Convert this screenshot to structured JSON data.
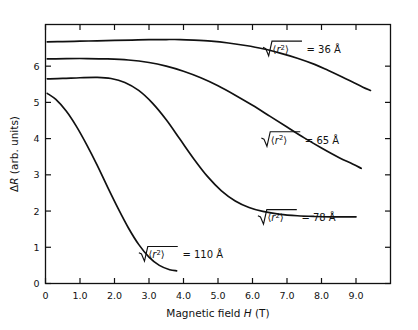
{
  "chart_data": {
    "type": "line",
    "title": "",
    "xlabel": "Magnetic field H (T)",
    "ylabel": "ΔR (arb. units)",
    "xlabel_parts": {
      "pre": "Magnetic  field  ",
      "italic": "H",
      "post": " (T)"
    },
    "ylabel_parts": {
      "delta": "Δ",
      "italic": "R",
      "post": " (arb. units)"
    },
    "xlim": [
      0,
      10.0
    ],
    "ylim": [
      0,
      7.15
    ],
    "xticks": [
      0,
      1.0,
      2.0,
      3.0,
      4.0,
      5.0,
      6.0,
      7.0,
      8.0,
      9.0
    ],
    "xticklabels": [
      "0",
      "1.0",
      "2.0",
      "3.0",
      "4.0",
      "5.0",
      "6.0",
      "7.0",
      "8.0",
      "9.0"
    ],
    "yticks": [
      0,
      1,
      2,
      3,
      4,
      5,
      6
    ],
    "yticklabels": [
      "0",
      "1",
      "2",
      "3",
      "4",
      "5",
      "6"
    ],
    "grid": false,
    "legend": "inline-annotations",
    "series": [
      {
        "name": "36 A",
        "label_prefix": "√",
        "label_radicand": "⟨r²⟩",
        "label_value": "= 36 Å",
        "label_x": 6.35,
        "label_y": 6.45,
        "x": [
          0.05,
          0.5,
          1.0,
          1.5,
          2.0,
          2.5,
          3.0,
          3.5,
          3.9,
          4.3,
          4.8,
          5.3,
          5.8,
          6.3,
          6.8,
          7.3,
          7.8,
          8.2,
          8.6,
          8.9,
          9.2,
          9.42
        ],
        "y": [
          6.67,
          6.68,
          6.69,
          6.7,
          6.71,
          6.72,
          6.73,
          6.735,
          6.735,
          6.72,
          6.69,
          6.64,
          6.57,
          6.48,
          6.36,
          6.22,
          6.05,
          5.88,
          5.7,
          5.56,
          5.42,
          5.33
        ]
      },
      {
        "name": "65 A",
        "label_prefix": "√",
        "label_radicand": "⟨r²⟩",
        "label_value": "= 65 Å",
        "label_x": 6.3,
        "label_y": 3.95,
        "x": [
          0.05,
          0.6,
          1.2,
          1.8,
          2.4,
          3.0,
          3.5,
          4.0,
          4.5,
          5.0,
          5.5,
          6.0,
          6.5,
          7.0,
          7.5,
          8.0,
          8.5,
          8.9,
          9.15
        ],
        "y": [
          6.2,
          6.21,
          6.21,
          6.2,
          6.17,
          6.1,
          6.0,
          5.86,
          5.68,
          5.46,
          5.2,
          4.92,
          4.62,
          4.32,
          4.02,
          3.74,
          3.48,
          3.3,
          3.18
        ]
      },
      {
        "name": "78 A",
        "label_prefix": "√",
        "label_radicand": "⟨r²⟩",
        "label_value": "= 78 Å",
        "label_x": 6.2,
        "label_y": 1.8,
        "x": [
          0.05,
          0.5,
          1.0,
          1.5,
          1.9,
          2.3,
          2.7,
          3.1,
          3.5,
          3.9,
          4.3,
          4.7,
          5.1,
          5.5,
          5.9,
          6.3,
          6.8,
          7.3,
          7.8,
          8.3,
          8.7,
          9.0
        ],
        "y": [
          5.65,
          5.66,
          5.68,
          5.69,
          5.66,
          5.55,
          5.33,
          4.98,
          4.52,
          3.98,
          3.44,
          2.95,
          2.56,
          2.28,
          2.1,
          1.99,
          1.91,
          1.87,
          1.85,
          1.84,
          1.84,
          1.84
        ]
      },
      {
        "name": "110 A",
        "label_prefix": "√",
        "label_radicand": "⟨r²⟩",
        "label_value": "= 110 Å",
        "label_x": 2.75,
        "label_y": 0.78,
        "x": [
          0.05,
          0.3,
          0.6,
          0.9,
          1.2,
          1.5,
          1.8,
          2.1,
          2.4,
          2.7,
          3.0,
          3.3,
          3.6,
          3.8
        ],
        "y": [
          5.25,
          5.08,
          4.76,
          4.33,
          3.82,
          3.26,
          2.66,
          2.08,
          1.54,
          1.08,
          0.73,
          0.5,
          0.38,
          0.35
        ]
      }
    ]
  },
  "figure": {
    "frame": "box",
    "tick_direction": "inward"
  }
}
